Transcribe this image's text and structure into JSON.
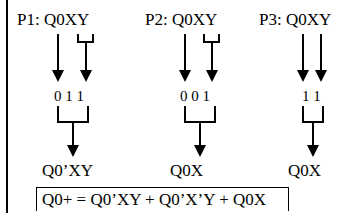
{
  "diagram": {
    "paths": [
      {
        "id": "P1",
        "header": "P1: Q0XY",
        "bits": "0 1 1",
        "result": "Q0’XY"
      },
      {
        "id": "P2",
        "header": "P2: Q0XY",
        "bits": "0 0 1",
        "result": "Q0’X’Y"
      },
      {
        "id": "P3",
        "header": "P3: Q0XY",
        "bits": "1 1",
        "result": "Q0X"
      }
    ],
    "equation": "Q0+ = Q0’XY + Q0’X’Y + Q0X"
  }
}
